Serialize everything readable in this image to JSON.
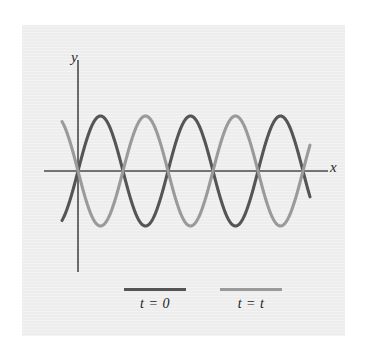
{
  "figure": {
    "background_color": "#ffffff",
    "plate_color": "#eeeeee",
    "axis_color": "#4a4a4a"
  },
  "axes": {
    "y_label": "y",
    "x_label": "x",
    "origin": [
      78,
      171
    ],
    "x_axis_extent": [
      44,
      328
    ],
    "y_axis_extent": [
      60,
      272
    ]
  },
  "legend": {
    "entries": [
      {
        "label": "t = 0",
        "color": "#555555",
        "swatch_name": "legend-swatch-t0"
      },
      {
        "label": "t = t",
        "color": "#9a9a9a",
        "swatch_name": "legend-swatch-tt"
      }
    ]
  },
  "chart_data": {
    "type": "line",
    "title": "",
    "subtitle": "",
    "xlabel": "x",
    "ylabel": "y",
    "grid": false,
    "legend_position": "bottom",
    "axis_origin_px": [
      78,
      171
    ],
    "x_range_px": [
      44,
      328
    ],
    "y_range_px": [
      60,
      272
    ],
    "amplitude_px": 55,
    "wavelength_px": 90,
    "series": [
      {
        "name": "t = 0",
        "color": "#555555",
        "form": "sine",
        "phase_deg": 0,
        "amplitude_px": 55,
        "wavelength_px": 90,
        "x_start_px": 62,
        "x_end_px": 310,
        "crest_x_px": [
          115,
          205,
          295
        ],
        "trough_x_px": [
          70,
          160,
          250
        ],
        "zero_crossings_x_px": [
          92,
          137,
          182,
          227,
          272,
          317
        ]
      },
      {
        "name": "t = t",
        "color": "#9a9a9a",
        "form": "sine",
        "phase_deg": 180,
        "amplitude_px": 55,
        "wavelength_px": 90,
        "x_start_px": 62,
        "x_end_px": 310,
        "crest_x_px": [
          160,
          250
        ],
        "trough_x_px": [
          98,
          188,
          278
        ],
        "zero_crossings_x_px": [
          78,
          123,
          168,
          213,
          258,
          303
        ]
      }
    ],
    "annotations": [
      {
        "text": "y",
        "role": "y-axis-label",
        "x_px": 74,
        "y_px": 56
      },
      {
        "text": "x",
        "role": "x-axis-label",
        "x_px": 333,
        "y_px": 167
      }
    ]
  }
}
